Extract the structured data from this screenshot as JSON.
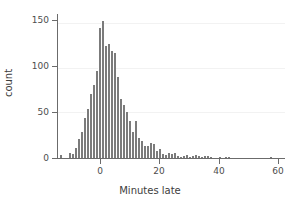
{
  "chart_data": {
    "type": "bar",
    "subtype": "histogram",
    "title": "",
    "xlabel": "Minutes late",
    "ylabel": "count",
    "xlim": [
      -14,
      62
    ],
    "ylim": [
      0,
      160
    ],
    "xticks": [
      0,
      20,
      40,
      60
    ],
    "yticks": [
      0,
      50,
      100,
      150
    ],
    "xtick_labels": [
      "0",
      "20",
      "40",
      "60"
    ],
    "ytick_labels": [
      "0",
      "50",
      "100",
      "150"
    ],
    "grid": "horizontal-faint",
    "legend": "none",
    "bin_width": 1,
    "bar_color": "#7b7b7b",
    "axis_color": "#6b6b6b",
    "background_color": "#ffffff",
    "categories": [
      -13,
      -12,
      -11,
      -10,
      -9,
      -8,
      -7,
      -6,
      -5,
      -4,
      -3,
      -2,
      -1,
      0,
      1,
      2,
      3,
      4,
      5,
      6,
      7,
      8,
      9,
      10,
      11,
      12,
      13,
      14,
      15,
      16,
      17,
      18,
      19,
      20,
      21,
      22,
      23,
      24,
      25,
      26,
      27,
      28,
      29,
      30,
      31,
      32,
      33,
      34,
      35,
      36,
      37,
      38,
      39,
      40,
      41,
      42,
      43,
      44,
      45,
      46,
      47,
      48,
      49,
      50,
      51,
      52,
      53,
      54,
      55,
      56,
      57
    ],
    "values": [
      3,
      0,
      0,
      6,
      4,
      11,
      21,
      29,
      45,
      55,
      72,
      82,
      97,
      146,
      153,
      125,
      128,
      120,
      117,
      91,
      66,
      59,
      51,
      41,
      29,
      41,
      22,
      19,
      14,
      13,
      17,
      16,
      8,
      10,
      4,
      3,
      6,
      4,
      6,
      2,
      1,
      2,
      3,
      1,
      2,
      3,
      2,
      1,
      2,
      2,
      1,
      0,
      0,
      1,
      0,
      1,
      1,
      0,
      0,
      0,
      0,
      0,
      0,
      0,
      0,
      0,
      0,
      0,
      0,
      0,
      1
    ],
    "peak_value": 153,
    "peak_category": 1
  },
  "axes": {
    "y_tick_0": "0",
    "y_tick_1": "50",
    "y_tick_2": "100",
    "y_tick_3": "150",
    "x_tick_0": "0",
    "x_tick_1": "20",
    "x_tick_2": "40",
    "x_tick_3": "60"
  }
}
